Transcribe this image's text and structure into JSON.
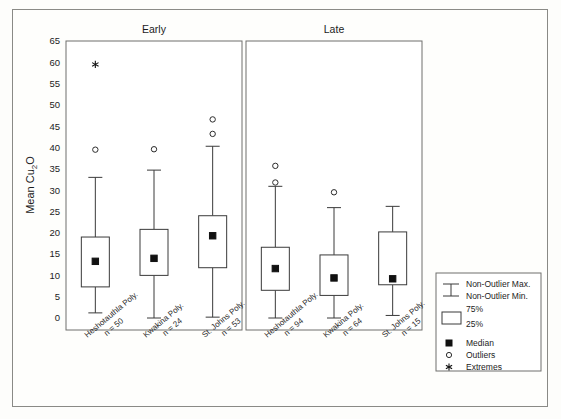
{
  "chart_data": {
    "type": "box",
    "title": "",
    "ylabel": "Mean Cu2O",
    "ylabel_main": "Mean Cu",
    "ylabel_sub": "2",
    "ylabel_tail": "O",
    "xlabel": "",
    "ylim": [
      0,
      65
    ],
    "yticks": [
      0,
      5,
      10,
      15,
      20,
      25,
      30,
      35,
      40,
      45,
      50,
      55,
      60,
      65
    ],
    "grid": false,
    "panels": [
      {
        "name": "Early",
        "label": "Early",
        "boxes": [
          {
            "category": "Heshotauthla Poly.",
            "n_label": "n = 50",
            "n": 50,
            "whisker_max": 33.0,
            "q3": 19.0,
            "median": 13.3,
            "q1": 7.3,
            "whisker_min": 1.2,
            "outliers": [
              39.5
            ],
            "extremes": [
              59.5
            ]
          },
          {
            "category": "Kwakina Poly.",
            "n_label": "n = 24",
            "n": 24,
            "whisker_max": 34.7,
            "q3": 20.8,
            "median": 14.0,
            "q1": 10.0,
            "whisker_min": 0.0,
            "outliers": [
              39.6
            ],
            "extremes": []
          },
          {
            "category": "St. Johns Poly.",
            "n_label": "n = 53",
            "n": 53,
            "whisker_max": 40.3,
            "q3": 24.0,
            "median": 19.3,
            "q1": 11.8,
            "whisker_min": 0.2,
            "outliers": [
              46.6,
              43.2
            ],
            "extremes": []
          }
        ]
      },
      {
        "name": "Late",
        "label": "Late",
        "boxes": [
          {
            "category": "Heshotauthla Poly.",
            "n_label": "n = 94",
            "n": 94,
            "whisker_max": 30.9,
            "q3": 16.6,
            "median": 11.6,
            "q1": 6.5,
            "whisker_min": 0.0,
            "outliers": [
              35.7,
              31.8
            ],
            "extremes": []
          },
          {
            "category": "Kwakina Poly.",
            "n_label": "n = 64",
            "n": 64,
            "whisker_max": 25.9,
            "q3": 14.8,
            "median": 9.4,
            "q1": 5.3,
            "whisker_min": 0.0,
            "outliers": [
              29.5
            ],
            "extremes": []
          },
          {
            "category": "St. Johns Poly.",
            "n_label": "n = 15",
            "n": 15,
            "whisker_max": 26.2,
            "q3": 20.2,
            "median": 9.2,
            "q1": 7.8,
            "whisker_min": 0.6,
            "outliers": [],
            "extremes": []
          }
        ]
      }
    ]
  },
  "legend": {
    "position": "right-bottom",
    "items": [
      {
        "key": "non-outlier-max",
        "label": "Non-Outlier Max."
      },
      {
        "key": "non-outlier-min",
        "label": "Non-Outlier Min."
      },
      {
        "key": "pct75",
        "label": "75%"
      },
      {
        "key": "pct25",
        "label": "25%"
      },
      {
        "key": "median",
        "label": "Median"
      },
      {
        "key": "outliers",
        "label": "Outliers"
      },
      {
        "key": "extremes",
        "label": "Extremes"
      }
    ]
  },
  "colors": {
    "frame": "#8a8a86",
    "panel_stroke": "#6f6f6c",
    "ink": "#1c1c1c",
    "marker": "#111111",
    "background": "#fdfdfb"
  }
}
